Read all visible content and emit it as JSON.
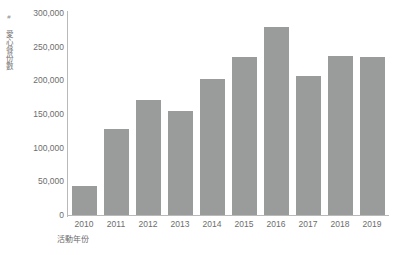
{
  "chart_data": {
    "type": "bar",
    "title": "",
    "xlabel": "活動年份",
    "ylabel": "# 愛心餐份數",
    "ylabel_prefix": "#",
    "ylabel_cjk": "愛心餐份數",
    "categories": [
      "2010",
      "2011",
      "2012",
      "2013",
      "2014",
      "2015",
      "2016",
      "2017",
      "2018",
      "2019"
    ],
    "values": [
      43000,
      128000,
      171000,
      154000,
      202000,
      235000,
      279000,
      206000,
      236000,
      235000
    ],
    "ylim": [
      0,
      300000
    ],
    "yticks": [
      0,
      50000,
      100000,
      150000,
      200000,
      250000,
      300000
    ],
    "ytick_labels": [
      "0",
      "50,000",
      "100,000",
      "150,000",
      "200,000",
      "250,000",
      "300,000"
    ],
    "grid": false,
    "legend": null,
    "bar_color": "#9a9b9b",
    "axis_color": "#b9b9b9",
    "text_color": "#6d6d6d"
  }
}
